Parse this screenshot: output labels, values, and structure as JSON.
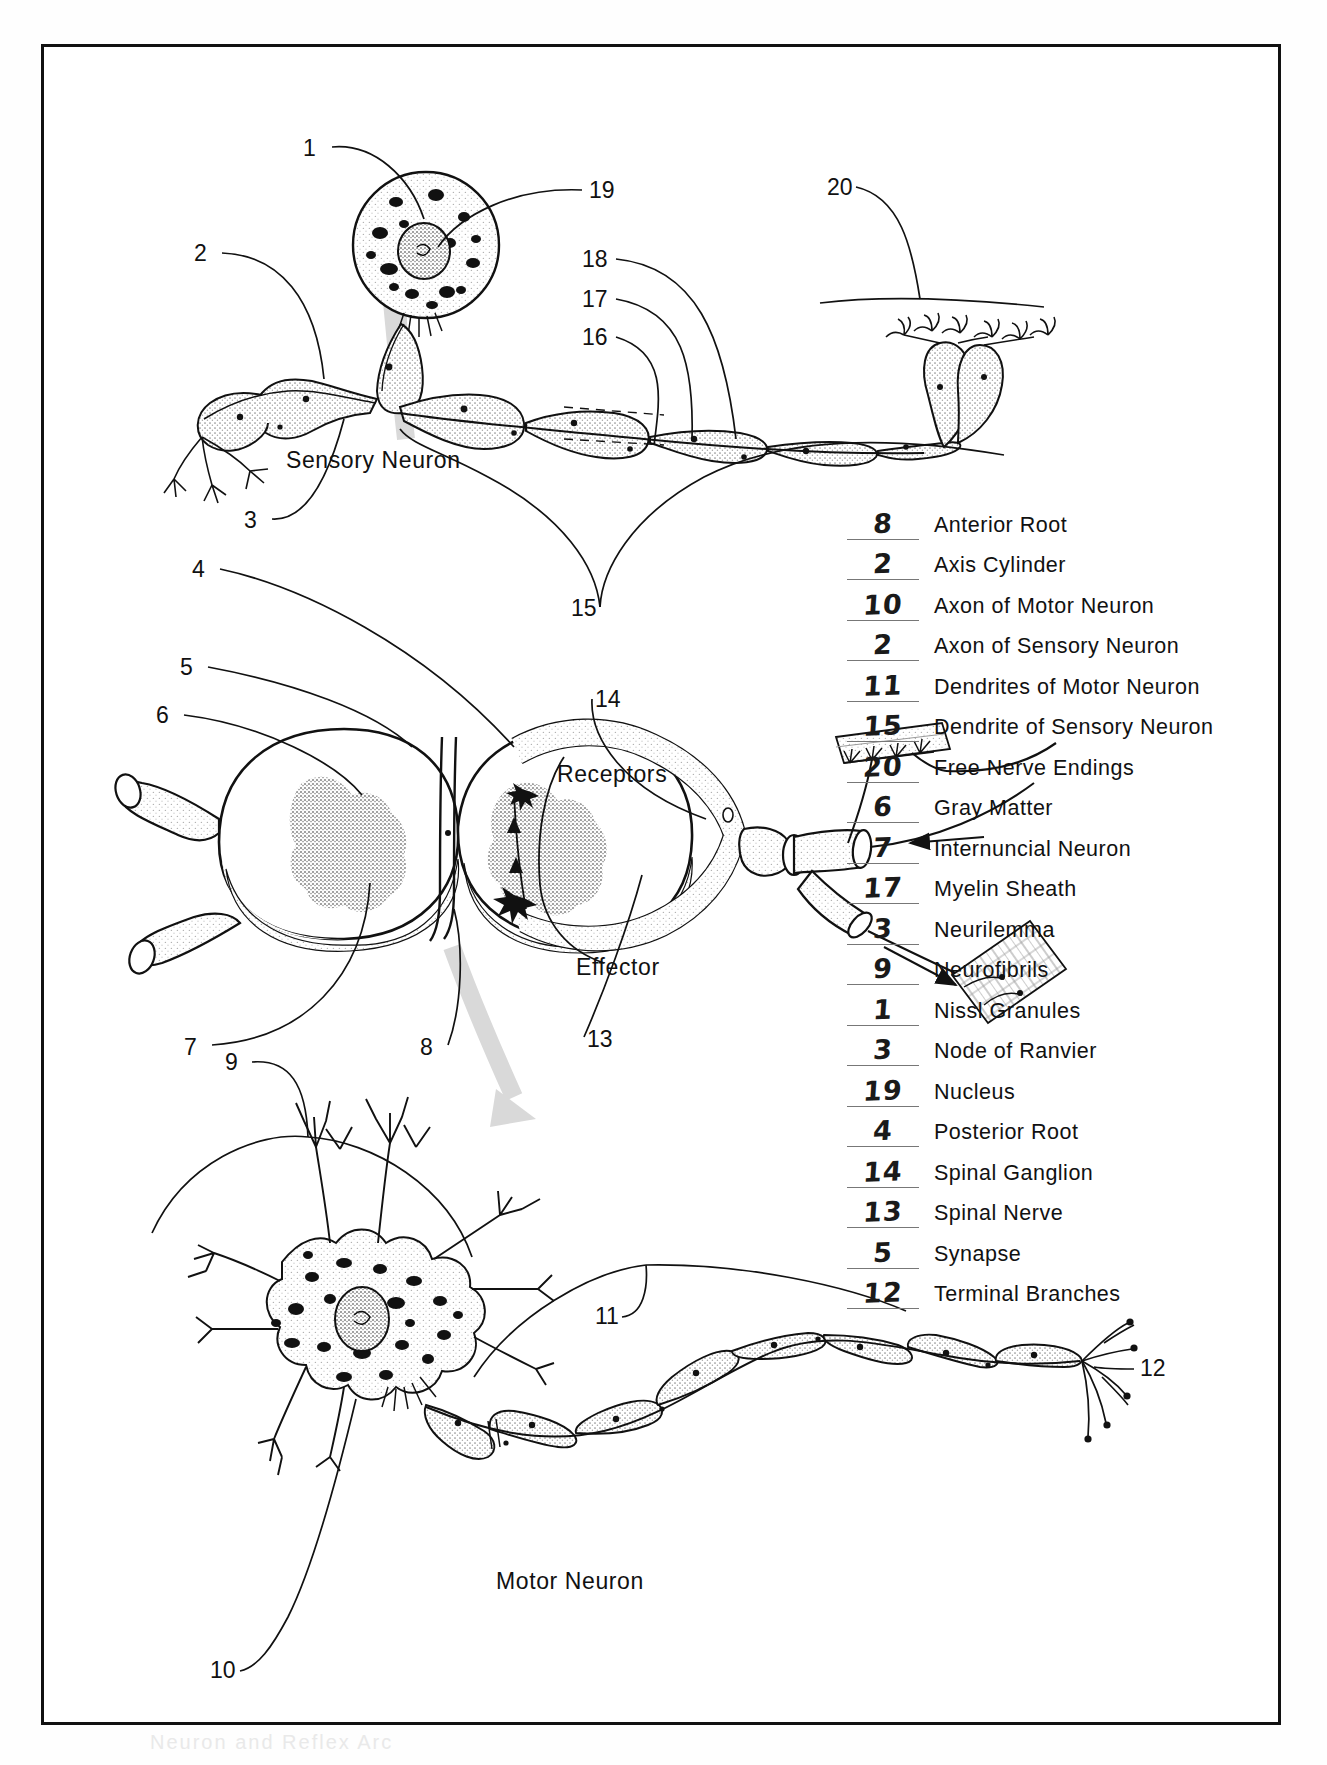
{
  "page": {
    "worksheet_title": "Neuron and Reflex Arc Labeling Worksheet",
    "faint_footer": "Neuron and Reflex Arc"
  },
  "diagrams": {
    "sensory": {
      "caption": "Sensory Neuron",
      "callouts": [
        "1",
        "19",
        "2",
        "18",
        "17",
        "16",
        "20",
        "3",
        "15"
      ]
    },
    "spinal_cord": {
      "callouts": [
        "4",
        "5",
        "6",
        "14",
        "7",
        "8",
        "13"
      ],
      "receptors_label": "Receptors",
      "effector_label": "Effector"
    },
    "motor": {
      "caption": "Motor Neuron",
      "callouts": [
        "9",
        "11",
        "12",
        "10"
      ]
    }
  },
  "answer_key": {
    "rows": [
      {
        "answer": "8",
        "term": "Anterior Root"
      },
      {
        "answer": "2",
        "term": "Axis Cylinder"
      },
      {
        "answer": "10",
        "term": "Axon of Motor Neuron"
      },
      {
        "answer": "2",
        "term": "Axon of Sensory Neuron"
      },
      {
        "answer": "11",
        "term": "Dendrites of Motor Neuron"
      },
      {
        "answer": "15",
        "term": "Dendrite of Sensory Neuron"
      },
      {
        "answer": "20",
        "term": "Free Nerve Endings"
      },
      {
        "answer": "6",
        "term": "Gray Matter"
      },
      {
        "answer": "7",
        "term": "Internuncial Neuron"
      },
      {
        "answer": "17",
        "term": "Myelin Sheath"
      },
      {
        "answer": "3",
        "term": "Neurilemma"
      },
      {
        "answer": "9",
        "term": "Neurofibrils"
      },
      {
        "answer": "1",
        "term": "Nissl Granules"
      },
      {
        "answer": "3",
        "term": "Node of Ranvier"
      },
      {
        "answer": "19",
        "term": "Nucleus"
      },
      {
        "answer": "4",
        "term": "Posterior Root"
      },
      {
        "answer": "14",
        "term": "Spinal Ganglion"
      },
      {
        "answer": "13",
        "term": "Spinal Nerve"
      },
      {
        "answer": "5",
        "term": "Synapse"
      },
      {
        "answer": "12",
        "term": "Terminal Branches"
      }
    ]
  },
  "colors": {
    "ink": "#111111",
    "paper": "#ffffff",
    "blank_rule": "#777777",
    "flow_arrow": "#d8d8d8",
    "stipple": "#9a9a9a"
  }
}
